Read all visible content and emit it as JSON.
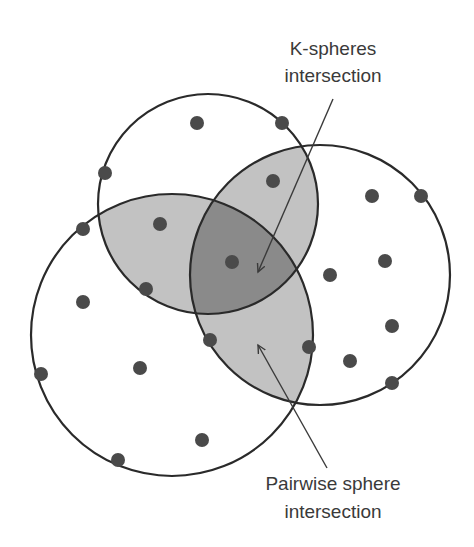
{
  "diagram": {
    "labels": {
      "top": [
        "K-spheres",
        "intersection"
      ],
      "bottom": [
        "Pairwise sphere",
        "intersection"
      ]
    },
    "colors": {
      "background": "#ffffff",
      "stroke": "#2a2a2a",
      "pairwise_fill": "#c2c2c2",
      "k_intersection_fill": "#8a8a8a",
      "point_fill": "#4a4a4a",
      "text": "#3a3a3a"
    },
    "spheres": [
      {
        "name": "top",
        "cx": 208,
        "cy": 204,
        "r": 110
      },
      {
        "name": "left",
        "cx": 172,
        "cy": 335,
        "r": 141
      },
      {
        "name": "right",
        "cx": 320,
        "cy": 275,
        "r": 130
      }
    ],
    "points": [
      [
        197,
        123
      ],
      [
        282,
        123
      ],
      [
        105,
        173
      ],
      [
        273,
        181
      ],
      [
        372,
        196
      ],
      [
        421,
        196
      ],
      [
        160,
        224
      ],
      [
        83,
        229
      ],
      [
        232,
        262
      ],
      [
        146,
        289
      ],
      [
        330,
        275
      ],
      [
        385,
        261
      ],
      [
        83,
        302
      ],
      [
        392,
        326
      ],
      [
        210,
        340
      ],
      [
        309,
        347
      ],
      [
        350,
        361
      ],
      [
        392,
        383
      ],
      [
        41,
        374
      ],
      [
        140,
        368
      ],
      [
        202,
        440
      ],
      [
        118,
        460
      ]
    ],
    "arrows": {
      "k_spheres": {
        "from": [
          333,
          99
        ],
        "to": [
          258,
          272
        ]
      },
      "pairwise": {
        "from": [
          327,
          468
        ],
        "to": [
          258,
          345
        ]
      }
    }
  }
}
